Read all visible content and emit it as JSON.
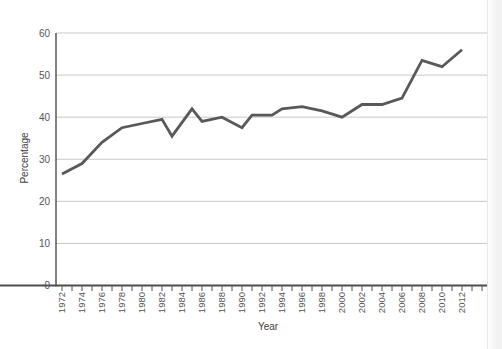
{
  "chart_data": {
    "type": "line",
    "title": "",
    "xlabel": "Year",
    "ylabel": "Percentage",
    "x": [
      1972,
      1974,
      1976,
      1978,
      1980,
      1982,
      1983,
      1985,
      1986,
      1988,
      1990,
      1991,
      1993,
      1994,
      1996,
      1998,
      2000,
      2002,
      2004,
      2006,
      2008,
      2010,
      2012
    ],
    "values": [
      26.5,
      29,
      34,
      37.5,
      38.5,
      39.5,
      35.5,
      42,
      39,
      40,
      37.5,
      40.5,
      40.5,
      42,
      42.5,
      41.5,
      40,
      43,
      43,
      44.5,
      53.5,
      52,
      56
    ],
    "ylim": [
      0,
      60
    ],
    "yticks": [
      0,
      10,
      20,
      30,
      40,
      50,
      60
    ],
    "ytick_labels": [
      "0",
      "10",
      "20",
      "30",
      "40",
      "50",
      "60"
    ],
    "xtick_labels": [
      "1972",
      "1974",
      "1976",
      "1978",
      "1980",
      "1982",
      "1984",
      "1986",
      "1988",
      "1990",
      "1992",
      "1994",
      "1996",
      "1998",
      "2000",
      "2002",
      "2004",
      "2006",
      "2008",
      "2010",
      "2012"
    ],
    "xtick_label_step": 2,
    "minor_tick_years": {
      "start": 1972,
      "end": 2014,
      "step": 1
    },
    "grid": true,
    "legend": "none",
    "line_color": "#58595B",
    "grid_color": "#c9c9c9",
    "axis_color": "#4d4d4d",
    "label_color": "#545557",
    "axis_title_color": "#3f4041"
  }
}
